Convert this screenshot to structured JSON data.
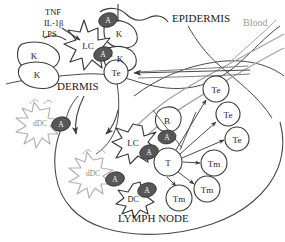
{
  "figure": {
    "type": "biomedical schematic",
    "background_color": "#ffffff",
    "ink_color": "#3a3a3a",
    "antigen_fill": "#5a5a5a",
    "blood_color": "#9a9a9a",
    "dermal_dc_color": "#b5b5b5"
  },
  "region_labels": [
    {
      "id": "epidermis",
      "text": "EPIDERMIS",
      "x": 172,
      "y": 22,
      "size": 11,
      "color": "#1a1a1a"
    },
    {
      "id": "dermis",
      "text": "DERMIS",
      "x": 57,
      "y": 90,
      "size": 11,
      "color": "#1a1a1a"
    },
    {
      "id": "lymph-node",
      "text": "LYMPH NODE",
      "x": 118,
      "y": 222,
      "size": 11,
      "color": "#1a1a1a"
    },
    {
      "id": "blood",
      "text": "Blood",
      "x": 243,
      "y": 26,
      "size": 10,
      "color": "#9a9a9a"
    }
  ],
  "cytokine_labels": [
    {
      "id": "tnf",
      "text": "TNF",
      "x": 45,
      "y": 15
    },
    {
      "id": "il1b",
      "text": "IL-1β",
      "x": 44,
      "y": 26
    },
    {
      "id": "lps",
      "text": "LPS",
      "x": 42,
      "y": 37
    }
  ],
  "cells": [
    {
      "id": "k1",
      "label": "K",
      "type": "keratinocyte",
      "x": 34,
      "y": 55,
      "r": 13
    },
    {
      "id": "k2",
      "label": "K",
      "type": "keratinocyte",
      "x": 37,
      "y": 74,
      "r": 12
    },
    {
      "id": "k3",
      "label": "K",
      "type": "keratinocyte",
      "x": 119,
      "y": 33,
      "r": 13
    },
    {
      "id": "k4",
      "label": "K",
      "type": "keratinocyte",
      "x": 120,
      "y": 58,
      "r": 12
    },
    {
      "id": "lc",
      "label": "LC",
      "type": "langerhans-cell",
      "x": 88,
      "y": 45,
      "r": 19
    },
    {
      "id": "te1",
      "label": "Te",
      "type": "effector-t-cell",
      "x": 116,
      "y": 72,
      "r": 12
    },
    {
      "id": "te2",
      "label": "Te",
      "type": "effector-t-cell",
      "x": 216,
      "y": 89,
      "r": 13
    },
    {
      "id": "te3",
      "label": "Te",
      "type": "effector-t-cell",
      "x": 228,
      "y": 114,
      "r": 12
    },
    {
      "id": "te4",
      "label": "Te",
      "type": "effector-t-cell",
      "x": 237,
      "y": 139,
      "r": 12
    },
    {
      "id": "b1",
      "label": "B",
      "type": "b-cell",
      "x": 167,
      "y": 120,
      "r": 13
    },
    {
      "id": "lc2",
      "label": "LC",
      "type": "langerhans-cell",
      "x": 133,
      "y": 142,
      "r": 20
    },
    {
      "id": "t1",
      "label": "T",
      "type": "naive-t-cell",
      "x": 168,
      "y": 162,
      "r": 14
    },
    {
      "id": "tm1",
      "label": "Tm",
      "type": "memory-t-cell",
      "x": 214,
      "y": 163,
      "r": 13
    },
    {
      "id": "tm2",
      "label": "Tm",
      "type": "memory-t-cell",
      "x": 207,
      "y": 189,
      "r": 13
    },
    {
      "id": "tm3",
      "label": "Tm",
      "type": "memory-t-cell",
      "x": 179,
      "y": 198,
      "r": 13
    },
    {
      "id": "ddc1",
      "label": "dDC",
      "type": "dermal-dendritic-cell",
      "x": 40,
      "y": 123,
      "r": 22
    },
    {
      "id": "ddc2",
      "label": "dDC",
      "type": "dermal-dendritic-cell",
      "x": 93,
      "y": 173,
      "r": 22
    },
    {
      "id": "dc1",
      "label": "DC",
      "type": "dendritic-cell",
      "x": 133,
      "y": 198,
      "r": 18
    }
  ],
  "antigens": [
    {
      "id": "a-k3",
      "attached_to": "k3",
      "label": "A",
      "x": 108,
      "y": 20
    },
    {
      "id": "a-lc",
      "attached_to": "lc",
      "label": "A",
      "x": 103,
      "y": 54
    },
    {
      "id": "a-ddc1",
      "attached_to": "ddc1",
      "label": "A",
      "x": 61,
      "y": 124
    },
    {
      "id": "a-b1",
      "attached_to": "b1",
      "label": "A",
      "x": 167,
      "y": 137
    },
    {
      "id": "a-lc2",
      "attached_to": "lc2",
      "label": "A",
      "x": 149,
      "y": 152
    },
    {
      "id": "a-ddc2",
      "attached_to": "ddc2",
      "label": "A",
      "x": 115,
      "y": 179
    },
    {
      "id": "a-dc1",
      "attached_to": "dc1",
      "label": "A",
      "x": 147,
      "y": 190
    }
  ],
  "arrows": [
    {
      "id": "arrow-cytokines-to-lc",
      "from": "cytokines",
      "to": "lc"
    },
    {
      "id": "arrow-blood-to-te1",
      "from": "blood-vessel",
      "to": "te1"
    },
    {
      "id": "arrow-ddc-migration-1",
      "from": "dermis",
      "to": "lymph-node"
    },
    {
      "id": "arrow-ddc-migration-2",
      "from": "dermis",
      "to": "lymph-node"
    },
    {
      "id": "arrow-lc-to-lymph",
      "from": "lc",
      "to": "lymph-node"
    },
    {
      "id": "arrow-t-to-te2",
      "from": "t1",
      "to": "te2"
    },
    {
      "id": "arrow-t-to-te3",
      "from": "t1",
      "to": "te3"
    },
    {
      "id": "arrow-t-to-te4",
      "from": "t1",
      "to": "te4"
    },
    {
      "id": "arrow-t-to-tm1",
      "from": "t1",
      "to": "tm1"
    },
    {
      "id": "arrow-t-to-tm2",
      "from": "t1",
      "to": "tm2"
    },
    {
      "id": "arrow-t-to-tm3",
      "from": "t1",
      "to": "tm3"
    }
  ]
}
